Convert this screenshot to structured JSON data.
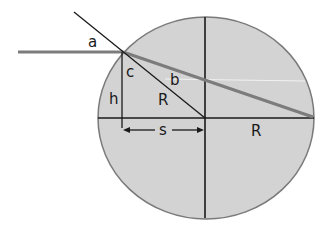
{
  "diagram": {
    "type": "geometric-optics-refraction-in-sphere",
    "colors": {
      "disk_fill": "#d3d3d3",
      "disk_stroke": "#7a7a7a",
      "line": "#1a1a1a",
      "ray": "#7c7c7c",
      "background": "#ffffff"
    },
    "labels": {
      "a": "a",
      "b": "b",
      "c": "c",
      "h": "h",
      "R_radius": "R",
      "s": "s",
      "R_axis": "R"
    }
  }
}
